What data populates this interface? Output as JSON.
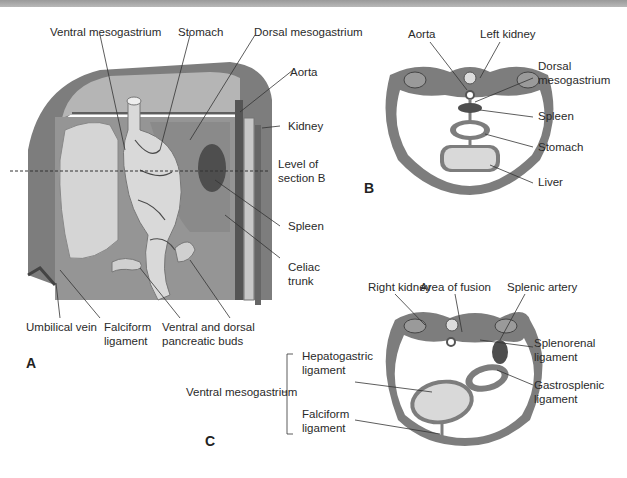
{
  "figure": {
    "panels": {
      "A": {
        "letter": "A",
        "labels": {
          "ventral_mesogastrium": "Ventral mesogastrium",
          "stomach": "Stomach",
          "dorsal_mesogastrium": "Dorsal mesogastrium",
          "aorta": "Aorta",
          "kidney": "Kidney",
          "level_line1": "Level of",
          "level_line2": "section B",
          "spleen": "Spleen",
          "celiac_line1": "Celiac",
          "celiac_line2": "trunk",
          "umbilical_vein": "Umbilical vein",
          "falciform_line1": "Falciform",
          "falciform_line2": "ligament",
          "pancreatic_line1": "Ventral and dorsal",
          "pancreatic_line2": "pancreatic buds"
        }
      },
      "B": {
        "letter": "B",
        "labels": {
          "aorta": "Aorta",
          "left_kidney": "Left kidney",
          "dorsal_line1": "Dorsal",
          "dorsal_line2": "mesogastrium",
          "spleen": "Spleen",
          "stomach": "Stomach",
          "liver": "Liver"
        }
      },
      "C": {
        "letter": "C",
        "labels": {
          "right_kidney": "Right kidney",
          "area_of_fusion": "Area of fusion",
          "splenic_artery": "Splenic artery",
          "splenorenal_line1": "Splenorenal",
          "splenorenal_line2": "ligament",
          "gastrosplenic_line1": "Gastrosplenic",
          "gastrosplenic_line2": "ligament",
          "ventral_mesogastrium": "Ventral mesogastrium",
          "hepatogastric_line1": "Hepatogastric",
          "hepatogastric_line2": "ligament",
          "falciform_line1": "Falciform",
          "falciform_line2": "ligament"
        }
      }
    },
    "colors": {
      "wall": "#7d7d7d",
      "wall_dark": "#5e5e5e",
      "cavity": "#9a9a9a",
      "organ_light": "#d9d9d9",
      "spleen": "#555555",
      "leader": "#333333"
    }
  }
}
